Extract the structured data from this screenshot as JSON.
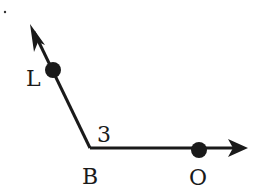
{
  "diagram": {
    "type": "angle",
    "vertex": {
      "label": "B",
      "x": 90,
      "y": 148
    },
    "rays": [
      {
        "name": "ray-BL",
        "point": {
          "label": "L",
          "x": 52,
          "y": 69
        },
        "end": {
          "x": 30,
          "y": 24
        }
      },
      {
        "name": "ray-BO",
        "point": {
          "label": "O",
          "x": 199,
          "y": 149
        },
        "end": {
          "x": 248,
          "y": 148
        }
      }
    ],
    "angle_label": "3",
    "stroke_color": "#1a1a1a"
  }
}
